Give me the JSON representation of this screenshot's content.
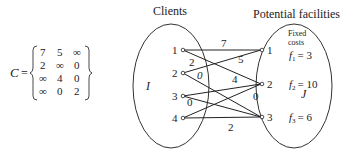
{
  "matrix": {
    "name": "C",
    "equals": "=",
    "rows": [
      [
        "7",
        "5",
        "∞"
      ],
      [
        "2",
        "∞",
        "0"
      ],
      [
        "∞",
        "4",
        "0"
      ],
      [
        "∞",
        "0",
        "2"
      ]
    ]
  },
  "clients": {
    "title": "Clients",
    "set_label": "I",
    "nodes": [
      "1",
      "2",
      "3",
      "4"
    ]
  },
  "facilities": {
    "title": "Potential facilities",
    "set_label": "J",
    "fixed_costs_label_line1": "Fixed",
    "fixed_costs_label_line2": "costs",
    "nodes": [
      "1",
      "2",
      "3"
    ],
    "costs": [
      {
        "name": "f",
        "sub": "1",
        "value": "= 3"
      },
      {
        "name": "f",
        "sub": "2",
        "value": "= 10"
      },
      {
        "name": "f",
        "sub": "3",
        "value": "= 6"
      }
    ]
  },
  "edges": [
    {
      "from": "1",
      "to": "1",
      "cost": "7"
    },
    {
      "from": "1",
      "to": "2",
      "cost": "5"
    },
    {
      "from": "2",
      "to": "1",
      "cost": "2"
    },
    {
      "from": "2",
      "to": "3",
      "cost": "0"
    },
    {
      "from": "3",
      "to": "2",
      "cost": "4"
    },
    {
      "from": "3",
      "to": "3",
      "cost": "0"
    },
    {
      "from": "4",
      "to": "2",
      "cost": "0"
    },
    {
      "from": "4",
      "to": "3",
      "cost": "2"
    }
  ]
}
